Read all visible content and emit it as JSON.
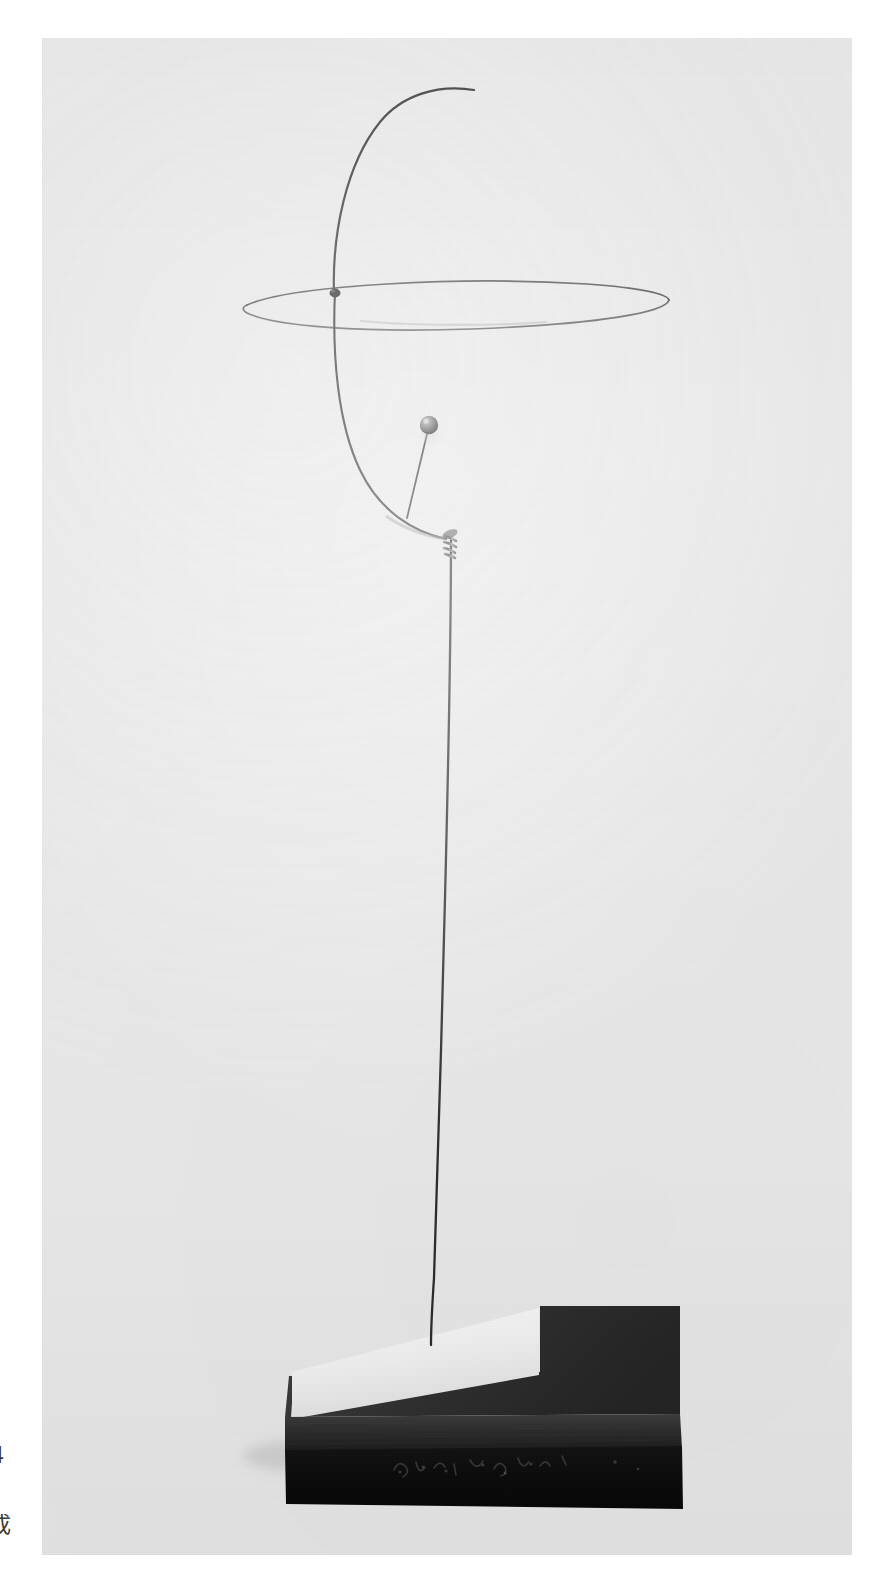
{
  "page": {
    "background_color": "#ffffff",
    "width": 883,
    "height": 1587
  },
  "marginalia": {
    "folio_number": "4",
    "caption_glyph": "成"
  },
  "photograph": {
    "background_color": "#e9e9e9",
    "frame": {
      "x": 42,
      "y": 38,
      "width": 810,
      "height": 1517
    },
    "subject": "wire sculpture on black plinth",
    "medium": "black-and-white photograph"
  },
  "sculpture": {
    "wire_color": "#2b2b2b",
    "elements": [
      {
        "name": "upper-arc",
        "label": "Upper curved wire arm",
        "description": "Tall arc rising from the circle crossing and curving right to a free tip"
      },
      {
        "name": "circle-ring",
        "label": "Wire circle in perspective",
        "description": "Large hoop seen nearly edge-on, reading as a narrow ellipse"
      },
      {
        "name": "lower-arc",
        "label": "Lower curved wire arm",
        "description": "Long sweep descending from the circle to the binding at the stem"
      },
      {
        "name": "bead-stem",
        "label": "Bead stem wire",
        "description": "Short straight wire carrying the sphere"
      },
      {
        "name": "bead",
        "label": "Metal sphere",
        "color": "#5c5c5c"
      },
      {
        "name": "binding-coil",
        "label": "Coiled wire binding",
        "description": "Several turns of wire lashing the arm to the vertical stem"
      },
      {
        "name": "vertical-stem",
        "label": "Vertical support wire",
        "description": "Thin wire running from the binding down into the base"
      },
      {
        "name": "knot-joint",
        "label": "Wire joint at circle crossing"
      }
    ]
  },
  "base": {
    "label": "Sculpture plinth",
    "plinth_color": "#1c1c1c",
    "top_inset_color": "#f4f4f4",
    "top_shadow_color": "#3a3a3a",
    "front_face_color": "#0c0c0c",
    "inscription": "signature incised in the front face",
    "inscription_legible": false
  }
}
